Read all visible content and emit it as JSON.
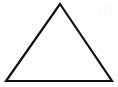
{
  "figure": {
    "shape_name": "triangle",
    "shape_type": "isosceles-triangle",
    "background_color": "#ffffff",
    "stroke_color": "#111111",
    "stroke_width": 2.2,
    "fill": "none",
    "canvas": {
      "width": 118,
      "height": 87
    },
    "vertices": [
      {
        "label": "apex",
        "x": 60,
        "y": 4
      },
      {
        "label": "base-right",
        "x": 112,
        "y": 81
      },
      {
        "label": "base-left",
        "x": 6,
        "y": 81
      }
    ],
    "points_attr": "60,4 112,81 6,81",
    "watermark": {
      "present": true,
      "color": "#fbfbfb",
      "description": "faint light-gray mark top-right",
      "x": 98,
      "y": 4,
      "width": 14,
      "height": 12
    }
  }
}
